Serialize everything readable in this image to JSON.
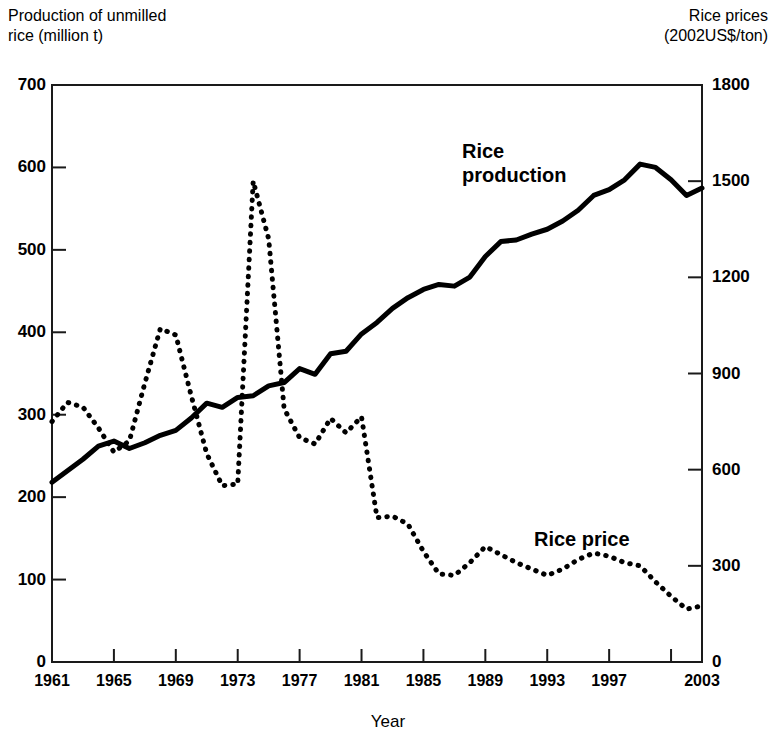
{
  "axes": {
    "left_title": "Production of unmilled\nrice (million t)",
    "right_title": "Rice prices\n(2002US$/ton)",
    "x_title": "Year",
    "y_left_ticks": [
      "0",
      "100",
      "200",
      "300",
      "400",
      "500",
      "600",
      "700"
    ],
    "y_right_ticks": [
      "0",
      "300",
      "600",
      "900",
      "1200",
      "1500",
      "1800"
    ],
    "x_ticks": [
      "1961",
      "1965",
      "1969",
      "1973",
      "1977",
      "1981",
      "1985",
      "1989",
      "1993",
      "1997",
      "2003"
    ]
  },
  "labels": {
    "production": "Rice\nproduction",
    "price": "Rice price"
  },
  "colors": {
    "line": "#000000",
    "background": "#ffffff",
    "frame": "#1a1a1a"
  },
  "chart_data": {
    "type": "line",
    "title": "",
    "xlabel": "Year",
    "ylabel": "Production of unmilled rice (million t)",
    "y2label": "Rice prices (2002US$/ton)",
    "xlim": [
      1961,
      2003
    ],
    "ylim": [
      0,
      700
    ],
    "y2lim": [
      0,
      1800
    ],
    "grid": false,
    "legend": "inline-annotations",
    "x": [
      1961,
      1962,
      1963,
      1964,
      1965,
      1966,
      1967,
      1968,
      1969,
      1970,
      1971,
      1972,
      1973,
      1974,
      1975,
      1976,
      1977,
      1978,
      1979,
      1980,
      1981,
      1982,
      1983,
      1984,
      1985,
      1986,
      1987,
      1988,
      1989,
      1990,
      1991,
      1992,
      1993,
      1994,
      1995,
      1996,
      1997,
      1998,
      1999,
      2000,
      2001,
      2002,
      2003
    ],
    "series": [
      {
        "name": "Rice production",
        "axis": "left",
        "style": "solid",
        "unit": "million t",
        "values": [
          218,
          232,
          246,
          262,
          268,
          259,
          266,
          275,
          281,
          296,
          314,
          309,
          321,
          323,
          335,
          339,
          356,
          349,
          374,
          377,
          398,
          412,
          429,
          442,
          452,
          458,
          456,
          467,
          492,
          510,
          512,
          519,
          525,
          535,
          548,
          566,
          573,
          585,
          604,
          600,
          585,
          566,
          575
        ]
      },
      {
        "name": "Rice price",
        "axis": "right",
        "style": "dotted",
        "unit": "2002US$/ton",
        "values": [
          750,
          810,
          795,
          730,
          655,
          690,
          870,
          1040,
          1020,
          830,
          650,
          550,
          555,
          1500,
          1320,
          790,
          700,
          680,
          760,
          715,
          765,
          450,
          455,
          430,
          345,
          275,
          270,
          310,
          360,
          335,
          310,
          290,
          270,
          290,
          320,
          340,
          330,
          310,
          300,
          250,
          205,
          165,
          175
        ]
      }
    ],
    "annotations": [
      {
        "text": "Rice production",
        "x": 1993,
        "y": 640
      },
      {
        "text": "Rice price",
        "x": 1992,
        "y": 185
      }
    ]
  }
}
